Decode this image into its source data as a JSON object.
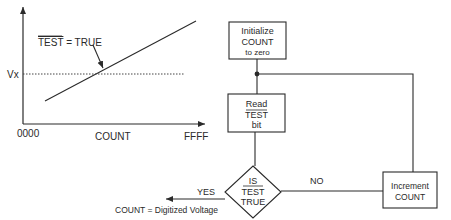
{
  "graph": {
    "y_label": "Vx",
    "x_label": "COUNT",
    "x_min_label": "0000",
    "x_max_label": "FFFF",
    "annotation_overbar": "TEST",
    "annotation_rest": " = TRUE"
  },
  "flowchart": {
    "init_box": {
      "line1": "Initialize",
      "line2": "COUNT",
      "line3": "to zero"
    },
    "read_box": {
      "line1": "Read",
      "line2": "TEST",
      "line3": "bit"
    },
    "decision": {
      "line1": "IS",
      "line2": "TEST",
      "line3": "TRUE"
    },
    "increment_box": {
      "line1": "Increment",
      "line2": "COUNT"
    },
    "no_label": "NO",
    "yes_label": "YES",
    "result_label": "COUNT = Digitized Voltage"
  },
  "colors": {
    "stroke": "#2a2a2a",
    "background": "#ffffff"
  }
}
